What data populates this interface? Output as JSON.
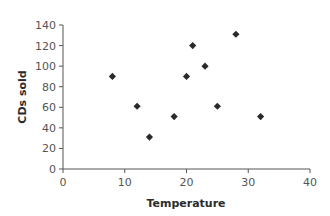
{
  "chart_data": {
    "type": "scatter",
    "title": "",
    "xlabel": "Temperature",
    "ylabel": "CDs sold",
    "xlim": [
      0,
      40
    ],
    "ylim": [
      0,
      140
    ],
    "xticks": [
      0,
      10,
      20,
      30,
      40
    ],
    "yticks": [
      0,
      20,
      40,
      60,
      80,
      100,
      120,
      140
    ],
    "grid": false,
    "legend": null,
    "marker": "diamond",
    "marker_color": "#2a2a2a",
    "series": [
      {
        "name": "CDs sold",
        "points": [
          {
            "x": 8,
            "y": 90
          },
          {
            "x": 12,
            "y": 61
          },
          {
            "x": 14,
            "y": 31
          },
          {
            "x": 18,
            "y": 51
          },
          {
            "x": 20,
            "y": 90
          },
          {
            "x": 21,
            "y": 120
          },
          {
            "x": 23,
            "y": 100
          },
          {
            "x": 25,
            "y": 61
          },
          {
            "x": 28,
            "y": 131
          },
          {
            "x": 32,
            "y": 51
          }
        ]
      }
    ]
  },
  "labels": {
    "x_axis_title": "Temperature",
    "y_axis_title": "CDs sold"
  }
}
